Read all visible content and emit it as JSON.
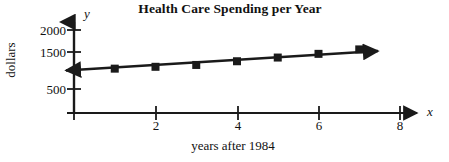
{
  "chart_data": {
    "type": "line",
    "title": "Health Care Spending per Year",
    "xlabel": "years after 1984",
    "ylabel": "dollars",
    "x_axis_letter": "x",
    "y_axis_letter": "y",
    "x": [
      1,
      2,
      3,
      4,
      5,
      6,
      7
    ],
    "values": [
      1050,
      1100,
      1150,
      1250,
      1350,
      1450,
      1570
    ],
    "series": [
      {
        "name": "Health care spending",
        "x": [
          1,
          2,
          3,
          4,
          5,
          6,
          7
        ],
        "values": [
          1050,
          1100,
          1150,
          1250,
          1350,
          1450,
          1570
        ]
      }
    ],
    "xlim": [
      0,
      8.4
    ],
    "ylim": [
      0,
      2100
    ],
    "x_ticks": [
      2,
      4,
      6,
      8
    ],
    "x_tick_labels": [
      "2",
      "4",
      "6",
      "8"
    ],
    "y_ticks": [
      500,
      1000,
      1500,
      2000
    ],
    "y_tick_labels": [
      "500",
      "",
      "1500",
      "2000"
    ],
    "grid": false,
    "legend": "none",
    "marker": "square",
    "line_color": "#1a1a1a",
    "marker_color": "#1a1a1a",
    "axis_color": "#1a1a1a",
    "background_color": "#ffffff",
    "annotations": [
      "Trend line extends with arrowheads at both ends",
      "Axes drawn with arrowheads pointing up and right"
    ]
  }
}
